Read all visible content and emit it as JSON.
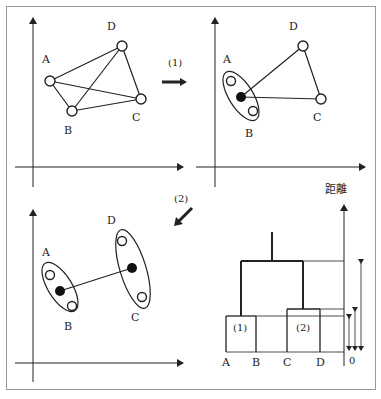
{
  "panels": {
    "p1": {
      "points": [
        "A",
        "B",
        "C",
        "D"
      ]
    },
    "p2": {
      "points": [
        "A",
        "B",
        "C",
        "D"
      ]
    },
    "p3": {
      "points": [
        "A",
        "B",
        "C",
        "D"
      ]
    }
  },
  "steps": {
    "step1": "(1)",
    "step2": "(2)"
  },
  "dendrogram": {
    "axis_label": "距離",
    "zero_label": "0",
    "leaves": [
      "A",
      "B",
      "C",
      "D"
    ],
    "cluster1_label": "(1)",
    "cluster2_label": "(2)"
  },
  "colors": {
    "line": "#222222",
    "frame": "#9a9a9a"
  }
}
